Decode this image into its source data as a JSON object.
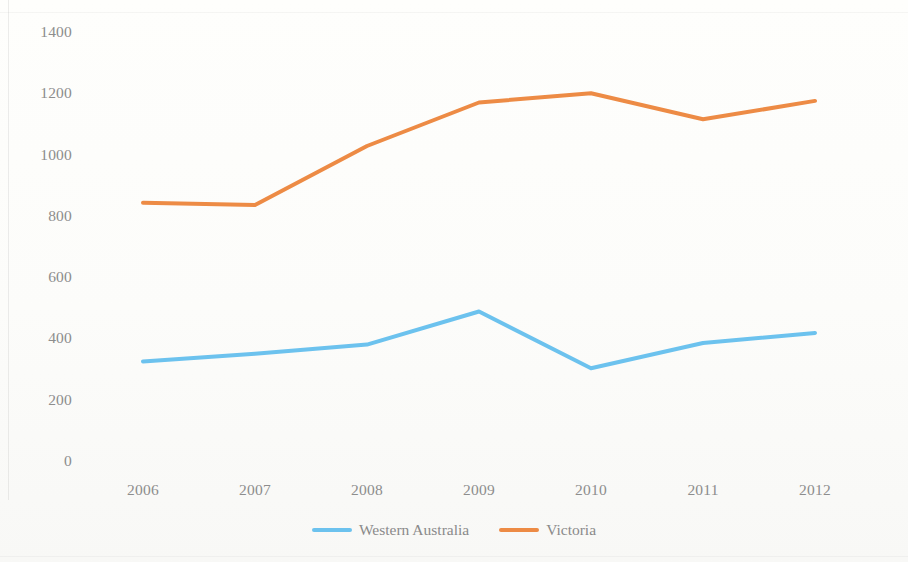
{
  "chart_data": {
    "type": "line",
    "title": "",
    "subtitle": "",
    "xlabel": "",
    "ylabel": "",
    "categories": [
      "2006",
      "2007",
      "2008",
      "2009",
      "2010",
      "2011",
      "2012"
    ],
    "series": [
      {
        "name": "Western Australia",
        "color": "#6CC2EE",
        "values": [
          325,
          350,
          380,
          488,
          303,
          385,
          418
        ]
      },
      {
        "name": "Victoria",
        "color": "#ED8B45",
        "values": [
          843,
          835,
          1028,
          1170,
          1200,
          1115,
          1175
        ]
      }
    ],
    "ylim": [
      0,
      1400
    ],
    "y_ticks": [
      0,
      200,
      400,
      600,
      800,
      1000,
      1200,
      1400
    ],
    "y_tick_labels": [
      "0",
      "200",
      "400",
      "600",
      "800",
      "1000",
      "1200",
      "1400"
    ],
    "x_tick_labels": [
      "2006",
      "2007",
      "2008",
      "2009",
      "2010",
      "2011",
      "2012"
    ],
    "grid": false,
    "legend_position": "bottom",
    "markers": false,
    "line_width": 4
  },
  "legend": {
    "entries": [
      {
        "label": "Western Australia",
        "color": "#6CC2EE"
      },
      {
        "label": "Victoria",
        "color": "#ED8B45"
      }
    ]
  },
  "axes": {
    "y_labels": [
      "1400",
      "1200",
      "1000",
      "800",
      "600",
      "400",
      "200",
      "0"
    ],
    "x_labels": [
      "2006",
      "2007",
      "2008",
      "2009",
      "2010",
      "2011",
      "2012"
    ]
  },
  "colors": {
    "western_australia": "#6CC2EE",
    "victoria": "#ED8B45",
    "tick_text": "#8d8d8d",
    "background": "#fdfdfb"
  }
}
